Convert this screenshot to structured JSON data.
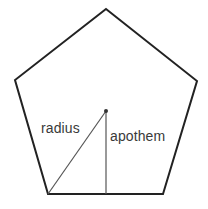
{
  "figure": {
    "type": "geometry-diagram",
    "shape_name": "regular-pentagon",
    "background_color": "#ffffff",
    "outline_color": "#222222",
    "interior_line_color": "#555555",
    "label_color": "#3a3a3a",
    "outline_width": 2,
    "interior_line_width": 1,
    "canvas": {
      "width": 208,
      "height": 209
    }
  },
  "pentagon": {
    "vertices": [
      {
        "name": "apex",
        "x": 106,
        "y": 9
      },
      {
        "name": "upper-right",
        "x": 197,
        "y": 81
      },
      {
        "name": "lower-right",
        "x": 163,
        "y": 194
      },
      {
        "name": "lower-left",
        "x": 48,
        "y": 194
      },
      {
        "name": "upper-left",
        "x": 15,
        "y": 80
      }
    ],
    "points_attr": "106,9 197,81 163,194 48,194 15,80"
  },
  "center_point": {
    "x": 106,
    "y": 111,
    "marker_radius": 2
  },
  "segments": [
    {
      "id": "radius",
      "label": "radius",
      "from": {
        "x": 106,
        "y": 111
      },
      "to": {
        "x": 48,
        "y": 194
      },
      "description": "center to vertex"
    },
    {
      "id": "apothem",
      "label": "apothem",
      "from": {
        "x": 106,
        "y": 111
      },
      "to": {
        "x": 106,
        "y": 194
      },
      "description": "center perpendicular to side midpoint"
    }
  ],
  "labels": {
    "radius": "radius",
    "apothem": "apothem"
  }
}
